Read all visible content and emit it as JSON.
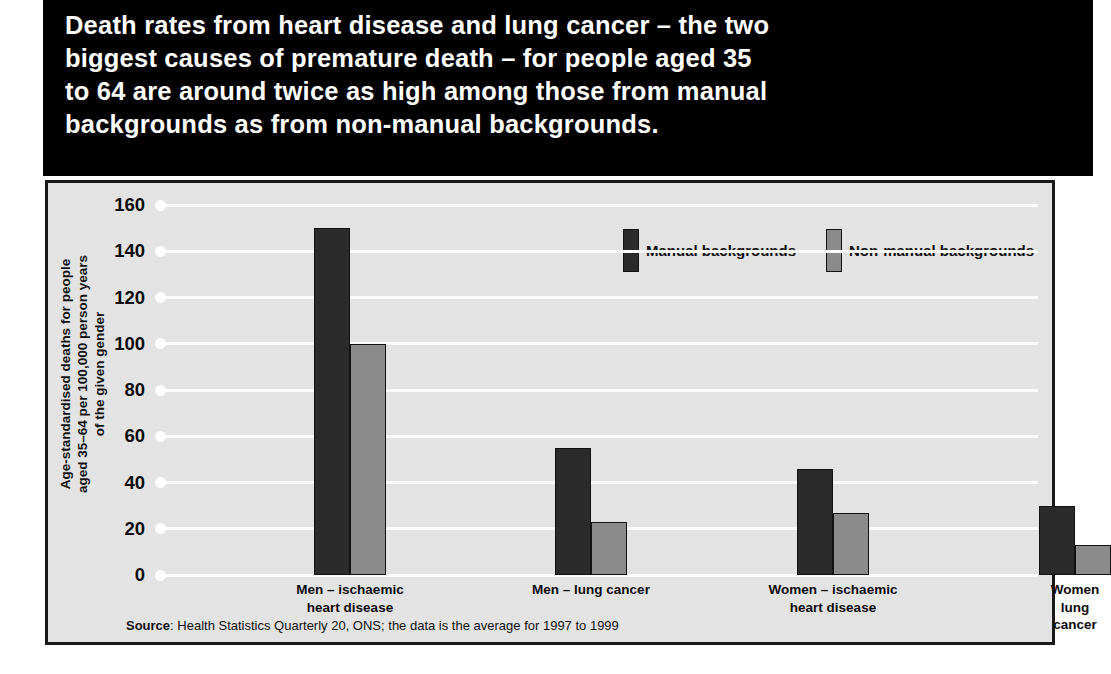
{
  "title": {
    "text": "Death rates from heart disease and lung cancer – the two\nbiggest causes of premature death – for people aged 35\nto 64 are around twice as high among those from manual\nbackgrounds as from non-manual backgrounds."
  },
  "colors": {
    "manual": "#2b2b2b",
    "non_manual": "#8b8b8b",
    "plot_background": "#e3e3e3",
    "title_background": "#000000",
    "gridline": "#fbfbfb",
    "frame": "#1a1a1a"
  },
  "legend": {
    "position": "top-right-inside-plot",
    "items": [
      {
        "label": "Manual backgrounds",
        "swatch": "manual"
      },
      {
        "label": "Non-manual backgrounds",
        "swatch": "non_manual"
      }
    ]
  },
  "source": {
    "prefix": "Source",
    "text": ": Health Statistics Quarterly 20, ONS; the data is the average for 1997 to 1999"
  },
  "chart_data": {
    "type": "bar",
    "title": "Death rates from heart disease and lung cancer – the two biggest causes of premature death – for people aged 35 to 64 are around twice as high among those from manual backgrounds as from non-manual backgrounds.",
    "xlabel": "",
    "ylabel": "Age-standardised deaths for people\naged 35–64 per 100,000 person years\nof the given gender",
    "categories": [
      "Men – ischaemic\nheart disease",
      "Men – lung cancer",
      "Women – ischaemic\nheart disease",
      "Women  lung\ncancer"
    ],
    "series": [
      {
        "name": "Manual backgrounds",
        "values": [
          150,
          55,
          46,
          30
        ]
      },
      {
        "name": "Non-manual backgrounds",
        "values": [
          100,
          23,
          27,
          13
        ]
      }
    ],
    "ylim": [
      0,
      160
    ],
    "ytick_step": 20,
    "yticks": [
      0,
      20,
      40,
      60,
      80,
      100,
      120,
      140,
      160
    ],
    "grid": true,
    "grid_axis": "y",
    "legend_position": "top-right"
  }
}
